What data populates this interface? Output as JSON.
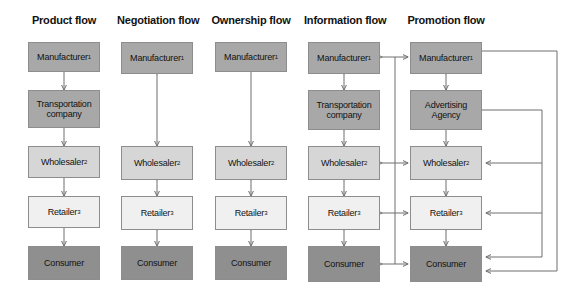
{
  "diagram": {
    "title_row": [
      "Product flow",
      "Negotiation flow",
      "Ownership flow",
      "Information flow",
      "Promotion flow"
    ],
    "node_labels": {
      "manufacturer": "Manufacturer",
      "manufacturer_sup": "1",
      "transportation": "Transportation\ncompany",
      "advertising": "Advertising\nAgency",
      "wholesaler": "Wholesaler",
      "wholesaler_sup": "2",
      "retailer": "Retailer",
      "retailer_sup": "3",
      "consumer": "Consumer"
    },
    "colors": {
      "manufacturer": "#a8a8a8",
      "transportation": "#a8a8a8",
      "advertising": "#a8a8a8",
      "wholesaler": "#d6d6d6",
      "retailer": "#f0f0f0",
      "consumer": "#8f8f8f",
      "border": "#8d8d8d",
      "arrow": "#6f6f6f",
      "text": "#111111",
      "background": "#ffffff"
    },
    "columns": [
      {
        "title": "Product flow",
        "nodes": [
          "Manufacturer1",
          "Transportation company",
          "Wholesaler2",
          "Retailer3",
          "Consumer"
        ],
        "connections": [
          {
            "from": "Manufacturer1",
            "to": "Transportation company",
            "direction": "down"
          },
          {
            "from": "Transportation company",
            "to": "Wholesaler2",
            "direction": "down"
          },
          {
            "from": "Wholesaler2",
            "to": "Retailer3",
            "direction": "down"
          },
          {
            "from": "Retailer3",
            "to": "Consumer",
            "direction": "down"
          }
        ]
      },
      {
        "title": "Negotiation flow",
        "nodes": [
          "Manufacturer1",
          "Wholesaler2",
          "Retailer3",
          "Consumer"
        ],
        "connections": [
          {
            "from": "Manufacturer1",
            "to": "Wholesaler2",
            "direction": "both"
          },
          {
            "from": "Wholesaler2",
            "to": "Retailer3",
            "direction": "both"
          },
          {
            "from": "Retailer3",
            "to": "Consumer",
            "direction": "both"
          }
        ]
      },
      {
        "title": "Ownership flow",
        "nodes": [
          "Manufacturer1",
          "Wholesaler2",
          "Retailer3",
          "Consumer"
        ],
        "connections": [
          {
            "from": "Manufacturer1",
            "to": "Wholesaler2",
            "direction": "down"
          },
          {
            "from": "Wholesaler2",
            "to": "Retailer3",
            "direction": "both"
          },
          {
            "from": "Retailer3",
            "to": "Consumer",
            "direction": "both"
          }
        ]
      },
      {
        "title": "Information flow",
        "nodes": [
          "Manufacturer1",
          "Transportation company",
          "Wholesaler2",
          "Retailer3",
          "Consumer"
        ],
        "connections": [
          {
            "from": "Manufacturer1",
            "to": "Transportation company",
            "direction": "both"
          },
          {
            "from": "Transportation company",
            "to": "Wholesaler2",
            "direction": "both"
          },
          {
            "from": "Wholesaler2",
            "to": "Retailer3",
            "direction": "both"
          },
          {
            "from": "Retailer3",
            "to": "Consumer",
            "direction": "both"
          },
          {
            "from": "Manufacturer1",
            "to": "bus",
            "direction": "both"
          },
          {
            "from": "Wholesaler2",
            "to": "bus",
            "direction": "both"
          },
          {
            "from": "Retailer3",
            "to": "bus",
            "direction": "both"
          },
          {
            "from": "Consumer",
            "to": "bus",
            "direction": "both"
          }
        ]
      },
      {
        "title": "Promotion flow",
        "nodes": [
          "Manufacturer1",
          "Advertising Agency",
          "Wholesaler2",
          "Retailer3",
          "Consumer"
        ],
        "connections": [
          {
            "from": "Manufacturer1",
            "to": "Advertising Agency",
            "direction": "both"
          },
          {
            "from": "Advertising Agency",
            "to": "Wholesaler2",
            "direction": "down"
          },
          {
            "from": "Wholesaler2",
            "to": "Retailer3",
            "direction": "down"
          },
          {
            "from": "Retailer3",
            "to": "Consumer",
            "direction": "both"
          },
          {
            "from": "Advertising Agency",
            "to": "Wholesaler2",
            "direction": "right-bus"
          },
          {
            "from": "Advertising Agency",
            "to": "Retailer3",
            "direction": "right-bus"
          },
          {
            "from": "Advertising Agency",
            "to": "Consumer",
            "direction": "right-bus"
          },
          {
            "from": "Manufacturer1",
            "to": "Consumer",
            "direction": "outer-bus"
          }
        ]
      }
    ]
  }
}
